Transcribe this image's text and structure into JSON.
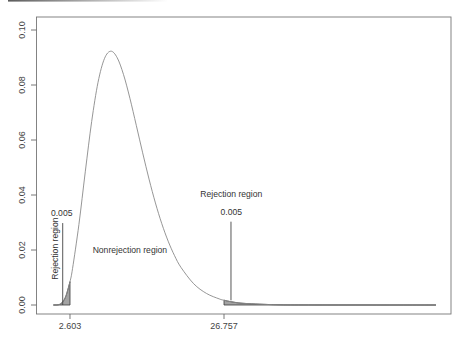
{
  "chart_data": {
    "type": "line",
    "title": "",
    "xlabel": "",
    "ylabel": "",
    "distribution": "chi-square density, df = 11",
    "xlim": [
      0,
      60
    ],
    "ylim": [
      0,
      0.1
    ],
    "grid": false,
    "legend": null,
    "y_ticks": [
      0.0,
      0.02,
      0.04,
      0.06,
      0.08,
      0.1
    ],
    "y_tick_labels": [
      "0.00",
      "0.02",
      "0.04",
      "0.06",
      "0.08",
      "0.10"
    ],
    "x_ticks": [
      2.603,
      26.757
    ],
    "x_tick_labels": [
      "2.603",
      "26.757"
    ],
    "points": [
      [
        0,
        0
      ],
      [
        0.5,
        1.45e-05
      ],
      [
        1,
        0.000256
      ],
      [
        1.5,
        0.00124
      ],
      [
        2,
        0.003514
      ],
      [
        2.603,
        0.00851
      ],
      [
        3,
        0.01321
      ],
      [
        4,
        0.02924
      ],
      [
        5,
        0.04842
      ],
      [
        6,
        0.06671
      ],
      [
        7,
        0.08098
      ],
      [
        8,
        0.08957
      ],
      [
        9,
        0.0923
      ],
      [
        10,
        0.08994
      ],
      [
        11,
        0.08377
      ],
      [
        12,
        0.07516
      ],
      [
        13,
        0.06534
      ],
      [
        14,
        0.05533
      ],
      [
        15,
        0.04578
      ],
      [
        16,
        0.03712
      ],
      [
        17,
        0.02958
      ],
      [
        18,
        0.0232
      ],
      [
        19,
        0.01795
      ],
      [
        20,
        0.01371
      ],
      [
        22,
        0.00774
      ],
      [
        24,
        0.00421
      ],
      [
        26,
        0.00222
      ],
      [
        26.757,
        0.00174
      ],
      [
        28,
        0.00114
      ],
      [
        30,
        0.000573
      ],
      [
        35,
        9.4e-05
      ],
      [
        40,
        1.41e-05
      ],
      [
        50,
        0
      ],
      [
        60,
        0
      ]
    ],
    "shaded_regions": [
      {
        "name": "lower-rejection",
        "from": 0,
        "to": 2.603,
        "area": 0.005
      },
      {
        "name": "upper-rejection",
        "from": 26.757,
        "to": 60,
        "area": 0.005
      }
    ],
    "annotations": {
      "lower_rejection_label": {
        "text": "Rejection region",
        "x": 0.25,
        "y": 0.0205,
        "rotated": true
      },
      "lower_alpha_label": {
        "text": "0.005",
        "x": 1.3,
        "y": 0.0335
      },
      "lower_pointer_line": {
        "x": 1.46,
        "y_from": 0,
        "y_to": 0.0298
      },
      "nonrejection_label": {
        "text": "Nonrejection region",
        "x": 12.0,
        "y": 0.02
      },
      "upper_rejection_label": {
        "text": "Rejection region",
        "x": 27.9,
        "y": 0.0402
      },
      "upper_alpha_label": {
        "text": "0.005",
        "x": 27.9,
        "y": 0.0338
      },
      "upper_pointer_line": {
        "x": 27.85,
        "y_from": 0.0017,
        "y_to": 0.0303
      }
    },
    "colors": {
      "curve": "#8a8a8a",
      "shade_fill": "#a3a3a3",
      "shade_edge": "#3a3a3a",
      "pointer_line": "#444444"
    }
  }
}
